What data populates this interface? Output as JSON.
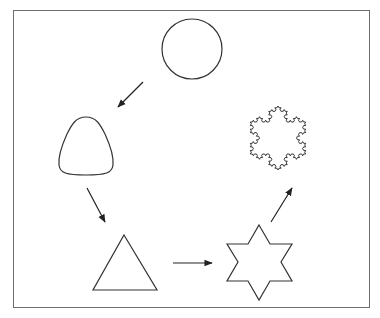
{
  "diagram": {
    "stroke_color": "#333333",
    "frame_color": "#6e6e6e",
    "nodes": [
      {
        "id": "circle",
        "shape": "circle"
      },
      {
        "id": "rounded-triangle",
        "shape": "rounded-triangle"
      },
      {
        "id": "triangle",
        "shape": "triangle"
      },
      {
        "id": "hexagram",
        "shape": "six-pointed-star"
      },
      {
        "id": "koch-snowflake",
        "shape": "koch-snowflake"
      }
    ],
    "edges": [
      {
        "from": "circle",
        "to": "rounded-triangle"
      },
      {
        "from": "rounded-triangle",
        "to": "triangle"
      },
      {
        "from": "triangle",
        "to": "hexagram"
      },
      {
        "from": "hexagram",
        "to": "koch-snowflake"
      }
    ]
  }
}
